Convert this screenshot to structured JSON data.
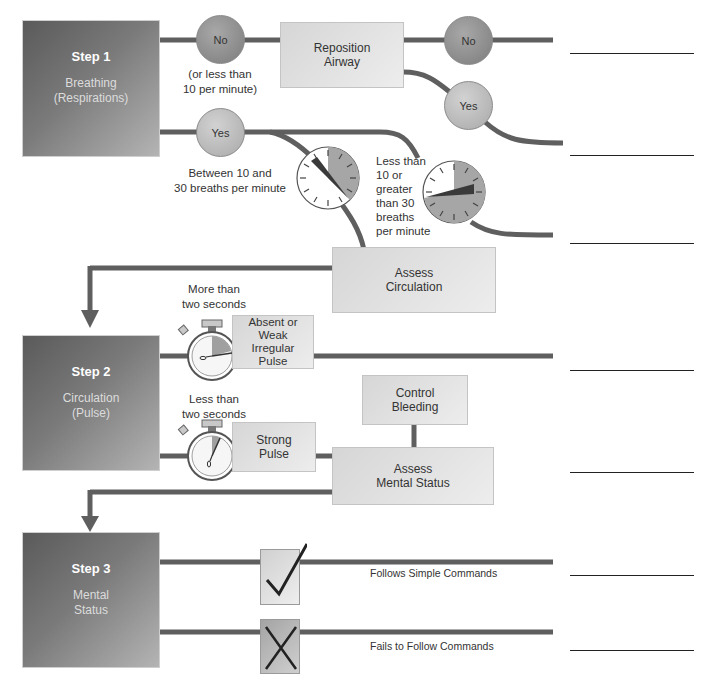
{
  "diagram": {
    "type": "triage-flowchart",
    "colors": {
      "connector": "#5f5f5f",
      "step_box_dark": "#5a5a5a",
      "step_box_light": "#b4b4b4",
      "action_box": "#e2e2e2",
      "circle_no": "#8c8c8c",
      "circle_yes": "#bdbdbd"
    },
    "steps": [
      {
        "title": "Step 1",
        "subtitle_line1": "Breathing",
        "subtitle_line2": "(Respirations)"
      },
      {
        "title": "Step 2",
        "subtitle_line1": "Circulation",
        "subtitle_line2": "(Pulse)"
      },
      {
        "title": "Step 3",
        "subtitle_line1": "Mental",
        "subtitle_line2": "Status"
      }
    ],
    "step1": {
      "no_circle": "No",
      "no_note_line1": "(or less than",
      "no_note_line2": "10 per minute)",
      "reposition_line1": "Reposition",
      "reposition_line2": "Airway",
      "reposition_no": "No",
      "reposition_yes": "Yes",
      "yes_circle": "Yes",
      "normal_rate_line1": "Between 10 and",
      "normal_rate_line2": "30 breaths per minute",
      "abnormal_rate_lines": [
        "Less than",
        "10 or",
        "greater",
        "than 30",
        "breaths",
        "per minute"
      ],
      "gauge_normal_icon": "respiration-gauge-normal-icon",
      "gauge_abnormal_icon": "respiration-gauge-abnormal-icon",
      "assess_line1": "Assess",
      "assess_line2": "Circulation"
    },
    "step2": {
      "slow_label_line1": "More than",
      "slow_label_line2": "two seconds",
      "slow_result_lines": [
        "Absent or",
        "Weak",
        "Irregular",
        "Pulse"
      ],
      "fast_label_line1": "Less than",
      "fast_label_line2": "two seconds",
      "fast_result_line1": "Strong",
      "fast_result_line2": "Pulse",
      "stopwatch_icon": "stopwatch-icon",
      "control_line1": "Control",
      "control_line2": "Bleeding",
      "assess_line1": "Assess",
      "assess_line2": "Mental Status"
    },
    "step3": {
      "follows_label": "Follows Simple Commands",
      "fails_label": "Fails to Follow Commands",
      "check_icon": "checkmark-icon",
      "x_icon": "x-mark-icon"
    },
    "answer_lines_count": 7
  }
}
